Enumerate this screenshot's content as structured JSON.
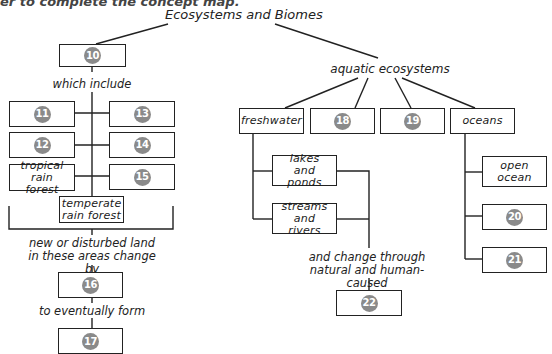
{
  "instruction": "er to complete the concept map.",
  "title": "Ecosystems and Biomes",
  "badge_color": "#8a8a8a",
  "left_branch": {
    "box_10": "10",
    "link_which_include": "which include",
    "biomes": [
      {
        "type": "blank",
        "number": "11"
      },
      {
        "type": "blank",
        "number": "13"
      },
      {
        "type": "blank",
        "number": "12"
      },
      {
        "type": "blank",
        "number": "14"
      },
      {
        "type": "text",
        "text": "tropical rain forest"
      },
      {
        "type": "blank",
        "number": "15"
      }
    ],
    "temperate": "temperate rain forest",
    "link_change": "new or disturbed land in these areas change by",
    "box_16": "16",
    "link_form": "to eventually form",
    "box_17": "17"
  },
  "right_branch": {
    "aquatic_label": "aquatic ecosystems",
    "freshwater": "freshwater",
    "box_18": "18",
    "box_19": "19",
    "oceans": "oceans",
    "lakes": "lakes and ponds",
    "streams": "streams and rivers",
    "link_change": "and change through natural and human-caused",
    "box_22": "22",
    "open_ocean": "open ocean",
    "box_20": "20",
    "box_21": "21"
  }
}
